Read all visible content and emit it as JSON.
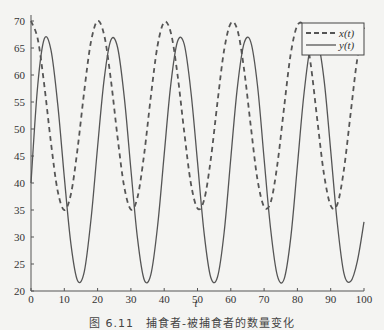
{
  "figure": {
    "caption": "图 6.11　捕食者-被捕食者的数量变化"
  },
  "chart_data": {
    "type": "line",
    "title": "",
    "xlabel": "t",
    "ylabel": "",
    "xlim": [
      0,
      100
    ],
    "ylim": [
      20,
      70
    ],
    "xticks": [
      0,
      10,
      20,
      30,
      40,
      50,
      60,
      70,
      80,
      90,
      100
    ],
    "yticks": [
      20,
      25,
      30,
      35,
      40,
      45,
      50,
      55,
      60,
      65,
      70
    ],
    "grid": false,
    "legend_position": "upper right",
    "x": [
      0,
      2,
      4,
      6,
      8,
      10,
      12,
      14,
      16,
      18,
      20,
      22,
      24,
      26,
      28,
      30,
      32,
      34,
      36,
      38,
      40,
      42,
      44,
      46,
      48,
      50,
      52,
      54,
      56,
      58,
      60,
      62,
      64,
      66,
      68,
      70,
      72,
      74,
      76,
      78,
      80,
      82,
      84,
      86,
      88,
      90,
      92,
      94,
      96,
      98,
      100
    ],
    "series": [
      {
        "name": "x(t)",
        "style": "dashed",
        "color": "#555555",
        "values": [
          70.0,
          66.7,
          58.1,
          47.4,
          38.6,
          35.0,
          38.0,
          46.4,
          57.1,
          66.1,
          70.0,
          67.3,
          59.1,
          48.4,
          39.3,
          35.1,
          37.4,
          45.4,
          56.1,
          65.4,
          69.8,
          67.8,
          60.1,
          49.5,
          40.0,
          35.3,
          36.9,
          44.4,
          55.0,
          64.6,
          69.6,
          68.3,
          61.0,
          50.5,
          40.7,
          35.6,
          36.5,
          43.5,
          54.0,
          63.9,
          69.2,
          68.7,
          62.0,
          51.5,
          41.6,
          35.8,
          36.1,
          42.6,
          53.0,
          63.0,
          68.8
        ]
      },
      {
        "name": "y(t)",
        "style": "solid",
        "color": "#555555",
        "values": [
          40.0,
          58.0,
          66.7,
          64.6,
          54.8,
          41.1,
          28.6,
          21.9,
          23.6,
          33.1,
          46.7,
          59.4,
          66.5,
          65.1,
          56.0,
          42.5,
          29.6,
          22.1,
          23.1,
          31.9,
          45.3,
          58.4,
          66.2,
          65.7,
          57.1,
          43.9,
          30.6,
          22.5,
          22.6,
          30.8,
          44.6,
          57.9,
          65.9,
          66.1,
          58.2,
          44.5,
          31.2,
          22.8,
          22.2,
          29.8,
          43.2,
          56.7,
          65.5,
          66.4,
          59.2,
          46.0,
          32.4,
          23.2,
          21.8,
          25.5,
          32.8
        ]
      }
    ]
  }
}
